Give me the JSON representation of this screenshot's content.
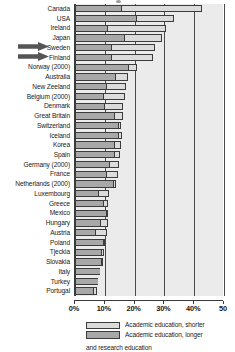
{
  "chart_data": {
    "type": "bar",
    "orientation": "horizontal",
    "stacked": true,
    "title": "",
    "xlabel": "",
    "ylabel": "",
    "xlim": [
      0,
      50
    ],
    "grid": true,
    "gridlines": [
      0,
      10,
      20,
      30,
      40,
      50
    ],
    "tick_labels": [
      "0%",
      "10%",
      "20%",
      "30%",
      "40%",
      "50"
    ],
    "legend_position": "bottom",
    "categories": [
      "Canada",
      "USA",
      "Ireland",
      "Japan",
      "Sweden",
      "Finland",
      "Norway (2000)",
      "Australia",
      "New Zeeland",
      "Belgium (2000)",
      "Denmark",
      "Great Britain",
      "Switzerland",
      "Iceland",
      "Korea",
      "Spain",
      "Germany (2000)",
      "France",
      "Netherlands (2000)",
      "Luxembourg",
      "Greece",
      "Mexico",
      "Hungary",
      "Austria",
      "Poland",
      "Tjeckia",
      "Slovakia",
      "Italy",
      "Turkey",
      "Portugal"
    ],
    "series": [
      {
        "name": "Academic education, longer and research education",
        "color": "#a8a8a8",
        "values": [
          15.5,
          20.5,
          10.7,
          16.5,
          12.2,
          12.0,
          17.7,
          13.5,
          10.5,
          9.5,
          9.6,
          13.2,
          14.3,
          14.4,
          13.1,
          13.1,
          11.3,
          10.5,
          12.6,
          7.7,
          9.3,
          10.4,
          8.4,
          6.7,
          9.3,
          8.7,
          8.7,
          8.4,
          7.7,
          6.1
        ]
      },
      {
        "name": "Academic education, shorter",
        "color": "#dcdcdc",
        "values": [
          27.2,
          12.6,
          20.0,
          12.6,
          14.8,
          14.3,
          3.0,
          4.4,
          6.6,
          7.3,
          6.5,
          2.8,
          1.3,
          1.4,
          2.5,
          2.1,
          3.3,
          3.9,
          1.0,
          3.8,
          1.8,
          0.5,
          2.6,
          4.0,
          0.7,
          0.9,
          0.4,
          0.0,
          0.0,
          1.2
        ]
      }
    ],
    "markers": [
      {
        "type": "arrow",
        "target": "Sweden"
      },
      {
        "type": "arrow",
        "target": "Finland"
      }
    ]
  },
  "legend": {
    "items": [
      {
        "label": "Academic education, shorter",
        "swatch": "light-gray"
      },
      {
        "label": "Academic education, longer",
        "swatch": "dark-gray"
      }
    ],
    "continuation": "and research education"
  }
}
